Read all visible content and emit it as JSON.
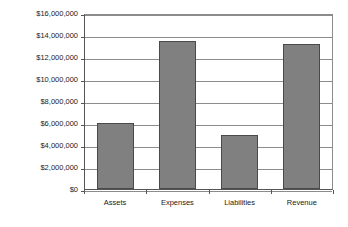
{
  "chart_data": {
    "type": "bar",
    "title": "",
    "subtitle": "",
    "xlabel": "",
    "ylabel": "",
    "categories": [
      "Assets",
      "Expenses",
      "Liabilities",
      "Revenue"
    ],
    "values": [
      6000000,
      13500000,
      4950000,
      13200000
    ],
    "ylim": [
      0,
      16000000
    ],
    "ytick_values": [
      0,
      2000000,
      4000000,
      6000000,
      8000000,
      10000000,
      12000000,
      14000000,
      16000000
    ],
    "ytick_labels": [
      "$0",
      "$2,000,000",
      "$4,000,000",
      "$6,000,000",
      "$8,000,000",
      "$10,000,000",
      "$12,000,000",
      "$14,000,000",
      "$16,000,000"
    ],
    "grid": "horizontal",
    "legend": "none",
    "bar_color": "#808080",
    "bar_border_color": "#4a4a4a",
    "gridline_color": "#8c8c8c",
    "axis_color": "#555555",
    "background_color": "#ffffff"
  }
}
